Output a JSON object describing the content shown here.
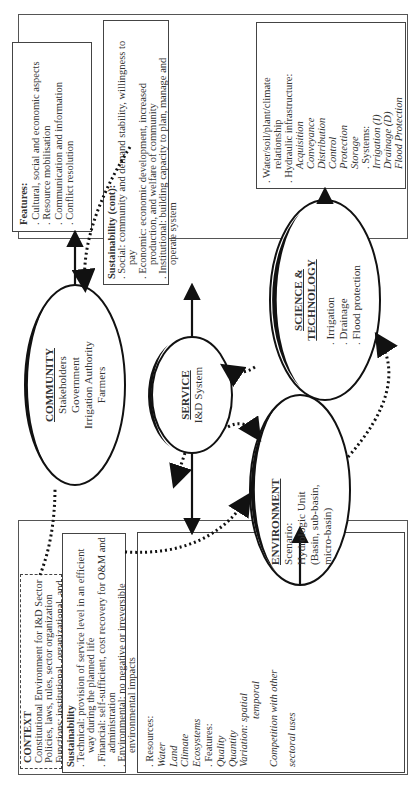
{
  "context": {
    "title": "CONTEXT",
    "lines": [
      "Constitutional Environment for I&D Sector",
      "Policies, laws, rules, sector organization",
      "Functions: institutional, organizational, and",
      "operational"
    ]
  },
  "sustainability": {
    "title": "Sustainability",
    "items": [
      {
        "first": ". Technical: provision of service level in an efficient",
        "cont": "way during the planned life"
      },
      {
        "first": ". Financial: self-sufficient, cost recovery for O&M and",
        "cont": "administration"
      },
      {
        "first": ". Environmental: no negative or irreversible",
        "cont": "environmental impacts"
      }
    ]
  },
  "resources": {
    "resources_label": ". Resources:",
    "resources": [
      "Water",
      "Land",
      "Climate",
      "Ecosystems"
    ],
    "features_label": ". Features:",
    "features": [
      "Quality",
      "Quantity"
    ],
    "variation": "Variation: spatial",
    "variation_cont": "temporal",
    "competition": "Competition with other",
    "competition_cont": "sectoral uses"
  },
  "features": {
    "title": "Features:",
    "items": [
      ". Cultural, social and economic aspects",
      ". Resource mobilisation",
      ". Communication and information",
      ". Conflict resolution"
    ]
  },
  "sustainability_cont": {
    "title": "Sustainability (cont):",
    "items": [
      {
        "first": ". Social: community and demand stability, willingness to",
        "cont": "pay"
      },
      {
        "first": ". Economic: economic development, increased",
        "cont": "production, and welfare of community"
      },
      {
        "first": ". Institutional: building capacity to plan, manage and",
        "cont": "operate system"
      }
    ]
  },
  "science_box": {
    "lines": [
      ". Water/soil/plant/climate",
      "relationship",
      ". Hydraulic infrastructure:"
    ],
    "infrastructure": [
      "Acquisition",
      "Conveyance",
      "Distribution",
      "Control",
      "Protection",
      "Storage"
    ],
    "systems_label": ". Systems:",
    "systems": [
      "Irrigation (I)",
      "Drainage (D)",
      "Flood Protection"
    ]
  },
  "nodes": {
    "community": {
      "name": "COMMUNITY",
      "lines": [
        "Stakeholders",
        "Government",
        "Irrigation Authority",
        "Farmers"
      ]
    },
    "service": {
      "name": "SERVICE",
      "lines": [
        "I&D System"
      ]
    },
    "environment": {
      "name": "ENVIRONMENT",
      "lines": [
        "Scenario:",
        "Hydrologic Unit",
        "(Basin, sub-basin,",
        "micro-basin)"
      ]
    },
    "science": {
      "name": "SCIENCE &",
      "name2": "TECHNOLOGY",
      "lines": [
        ". Irrigation",
        ". Drainage",
        ". Flood protection"
      ]
    }
  }
}
